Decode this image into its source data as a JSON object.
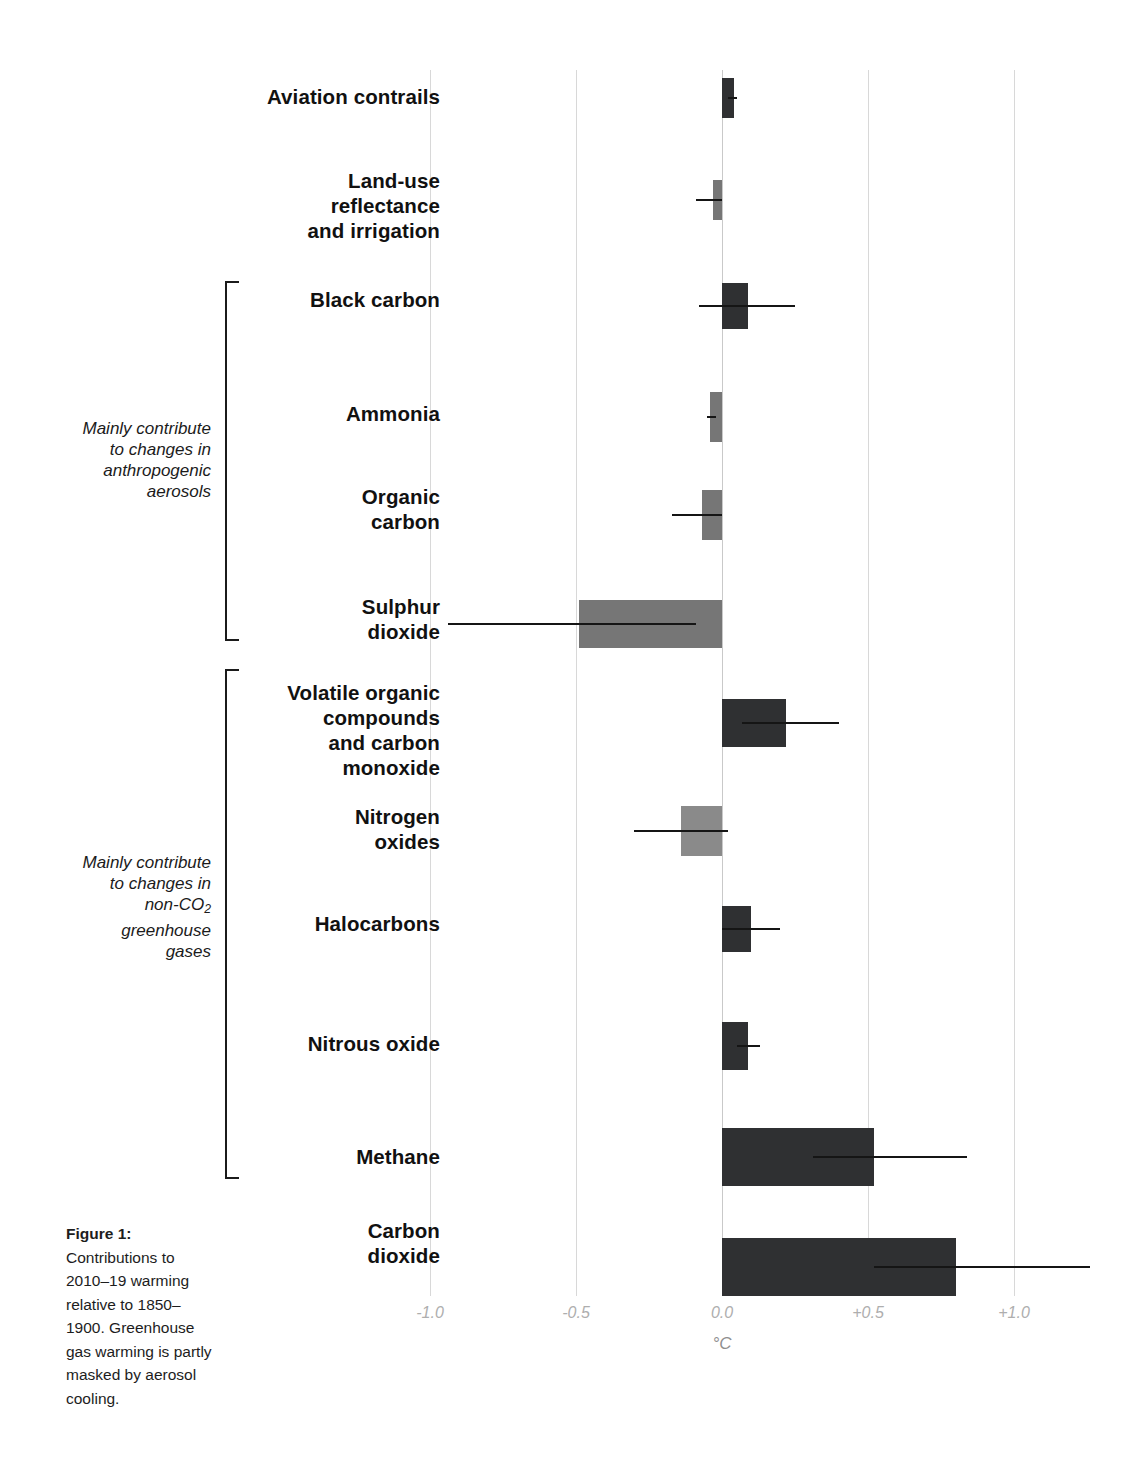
{
  "figure": {
    "caption_title": "Figure 1:",
    "caption_body": "Contributions to 2010–19 warming relative to 1850–1900. Greenhouse gas warming is partly masked by aerosol cooling."
  },
  "axis": {
    "unit_label": "°C",
    "tick_labels": [
      "-1.0",
      "-0.5",
      "0.0",
      "+0.5",
      "+1.0"
    ],
    "tick_values": [
      -1.0,
      -0.5,
      0.0,
      0.5,
      1.0
    ]
  },
  "groups": [
    {
      "label": "Mainly contribute to changes in anthropogenic aerosols",
      "label_lines": [
        "Mainly contribute",
        "to changes in",
        "anthropogenic",
        "aerosols"
      ],
      "members": [
        "Black carbon",
        "Ammonia",
        "Organic carbon",
        "Sulphur dioxide"
      ]
    },
    {
      "label": "Mainly contribute to changes in non-CO2 greenhouse gases",
      "label_lines": [
        "Mainly contribute",
        "to changes in",
        "non-CO",
        "greenhouse",
        "gases"
      ],
      "members": [
        "Volatile organic compounds and carbon monoxide",
        "Nitrogen oxides",
        "Halocarbons",
        "Nitrous oxide",
        "Methane"
      ]
    }
  ],
  "chart_data": {
    "type": "bar",
    "orientation": "horizontal",
    "title": "",
    "xlabel": "°C",
    "ylabel": "",
    "xlim": [
      -1.15,
      1.35
    ],
    "grid": true,
    "legend": "none",
    "categories": [
      "Aviation contrails",
      "Land-use reflectance and irrigation",
      "Black carbon",
      "Ammonia",
      "Organic carbon",
      "Sulphur dioxide",
      "Volatile organic compounds and carbon monoxide",
      "Nitrogen oxides",
      "Halocarbons",
      "Nitrous oxide",
      "Methane",
      "Carbon dioxide"
    ],
    "values": [
      0.04,
      -0.03,
      0.09,
      -0.04,
      -0.07,
      -0.49,
      0.22,
      -0.14,
      0.1,
      0.09,
      0.52,
      0.8
    ],
    "error_low": [
      0.02,
      -0.09,
      -0.08,
      -0.05,
      -0.17,
      -0.94,
      0.07,
      -0.3,
      0.0,
      0.05,
      0.31,
      0.52
    ],
    "error_high": [
      0.05,
      0.0,
      0.25,
      -0.02,
      0.0,
      -0.09,
      0.4,
      0.02,
      0.2,
      0.13,
      0.84,
      1.26
    ]
  },
  "bars": [
    {
      "name": "Aviation contrails",
      "label_lines": [
        "Aviation contrails"
      ],
      "value": 0.04,
      "low": 0.02,
      "high": 0.05,
      "color": "dark",
      "top": 78,
      "height": 40,
      "label_top": 84
    },
    {
      "name": "Land-use reflectance and irrigation",
      "label_lines": [
        "Land-use",
        "reflectance",
        "and irrigation"
      ],
      "value": -0.03,
      "low": -0.09,
      "high": 0.0,
      "color": "mid",
      "top": 180,
      "height": 40,
      "label_top": 168
    },
    {
      "name": "Black carbon",
      "label_lines": [
        "Black carbon"
      ],
      "value": 0.09,
      "low": -0.08,
      "high": 0.25,
      "color": "dark",
      "top": 283,
      "height": 46,
      "label_top": 287
    },
    {
      "name": "Ammonia",
      "label_lines": [
        "Ammonia"
      ],
      "value": -0.04,
      "low": -0.05,
      "high": -0.02,
      "color": "mid",
      "top": 392,
      "height": 50,
      "label_top": 401
    },
    {
      "name": "Organic carbon",
      "label_lines": [
        "Organic",
        "carbon"
      ],
      "value": -0.07,
      "low": -0.17,
      "high": 0.0,
      "color": "mid",
      "top": 490,
      "height": 50,
      "label_top": 484
    },
    {
      "name": "Sulphur dioxide",
      "label_lines": [
        "Sulphur",
        "dioxide"
      ],
      "value": -0.49,
      "low": -0.94,
      "high": -0.09,
      "color": "mid",
      "top": 600,
      "height": 48,
      "label_top": 594
    },
    {
      "name": "Volatile organic compounds and carbon monoxide",
      "label_lines": [
        "Volatile organic",
        "compounds",
        "and carbon",
        "monoxide"
      ],
      "value": 0.22,
      "low": 0.07,
      "high": 0.4,
      "color": "dark",
      "top": 699,
      "height": 48,
      "label_top": 680
    },
    {
      "name": "Nitrogen oxides",
      "label_lines": [
        "Nitrogen",
        "oxides"
      ],
      "value": -0.14,
      "low": -0.3,
      "high": 0.02,
      "color": "light",
      "top": 806,
      "height": 50,
      "label_top": 804
    },
    {
      "name": "Halocarbons",
      "label_lines": [
        "Halocarbons"
      ],
      "value": 0.1,
      "low": 0.0,
      "high": 0.2,
      "color": "dark",
      "top": 906,
      "height": 46,
      "label_top": 911
    },
    {
      "name": "Nitrous oxide",
      "label_lines": [
        "Nitrous oxide"
      ],
      "value": 0.09,
      "low": 0.05,
      "high": 0.13,
      "color": "dark",
      "top": 1022,
      "height": 48,
      "label_top": 1031
    },
    {
      "name": "Methane",
      "label_lines": [
        "Methane"
      ],
      "value": 0.52,
      "low": 0.31,
      "high": 0.84,
      "color": "dark",
      "top": 1128,
      "height": 58,
      "label_top": 1144
    },
    {
      "name": "Carbon dioxide",
      "label_lines": [
        "Carbon",
        "dioxide"
      ],
      "value": 0.8,
      "low": 0.52,
      "high": 1.26,
      "color": "dark",
      "top": 1238,
      "height": 58,
      "label_top": 1218
    }
  ]
}
